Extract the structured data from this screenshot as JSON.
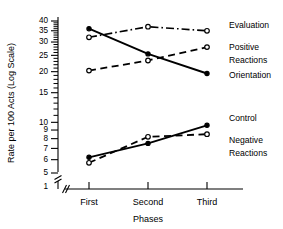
{
  "chart_data": {
    "type": "line",
    "title": "",
    "subtitle": "",
    "xlabel": "Phases",
    "ylabel": "Rate per 100 Acts (Log Scale)",
    "categories": [
      "First",
      "Second",
      "Third"
    ],
    "yscale": "log",
    "ylim": [
      5,
      40
    ],
    "y_axis_break": true,
    "y_axis_break_label": "1",
    "x_axis_break": true,
    "grid": false,
    "legend_position": "right-inline",
    "ytick_labels": [
      "40",
      "35",
      "30",
      "25",
      "20",
      "15",
      "10",
      "9",
      "8",
      "7",
      "6",
      "5",
      "1"
    ],
    "ytick_values": [
      40,
      35,
      30,
      25,
      20,
      15,
      10,
      9,
      8,
      7,
      6,
      5,
      1
    ],
    "yminor_ticks": [
      39,
      38,
      37,
      36,
      34,
      33,
      32,
      31,
      29,
      28,
      27,
      26,
      24,
      23,
      22,
      21,
      19,
      18,
      17,
      16,
      14,
      13,
      12,
      11
    ],
    "series": [
      {
        "name": "Evaluation",
        "values": [
          32,
          37,
          35
        ],
        "line_style": "dashdot",
        "marker": "open-circle",
        "label_x": 229,
        "label_y": 26
      },
      {
        "name": "Positive Reactions",
        "values": [
          20.3,
          23.3,
          28
        ],
        "line_style": "dashed",
        "marker": "open-circle",
        "label_x": 229,
        "label_y": 48
      },
      {
        "name": "Orientation",
        "values": [
          36,
          25.5,
          19.5
        ],
        "line_style": "solid",
        "marker": "filled-circle",
        "label_x": 229,
        "label_y": 76
      },
      {
        "name": "Control",
        "values": [
          6.2,
          7.5,
          9.6
        ],
        "line_style": "solid",
        "marker": "filled-circle",
        "label_x": 229,
        "label_y": 119
      },
      {
        "name": "Negative Reactions",
        "values": [
          5.75,
          8.2,
          8.5
        ],
        "line_style": "dashed",
        "marker": "open-circle",
        "label_x": 229,
        "label_y": 141
      }
    ],
    "series_label_lines": [
      {
        "name": "Evaluation",
        "lines": [
          "Evaluation"
        ]
      },
      {
        "name": "Positive Reactions",
        "lines": [
          "Positive",
          "Reactions"
        ]
      },
      {
        "name": "Orientation",
        "lines": [
          "Orientation"
        ]
      },
      {
        "name": "Control",
        "lines": [
          "Control"
        ]
      },
      {
        "name": "Negative Reactions",
        "lines": [
          "Negative",
          "Reactions"
        ]
      }
    ],
    "colors": {
      "ink": "#000000",
      "background": "#ffffff"
    }
  },
  "labels": {
    "y_axis_title": "Rate per 100 Acts (Log Scale)",
    "x_axis_title": "Phases",
    "x_first": "First",
    "x_second": "Second",
    "x_third": "Third",
    "y_40": "40",
    "y_35": "35",
    "y_30": "30",
    "y_25": "25",
    "y_20": "20",
    "y_15": "15",
    "y_10": "10",
    "y_9": "9",
    "y_8": "8",
    "y_7": "7",
    "y_6": "6",
    "y_5": "5",
    "y_1": "1",
    "s_evaluation": "Evaluation",
    "s_positive_1": "Positive",
    "s_positive_2": "Reactions",
    "s_orientation": "Orientation",
    "s_control": "Control",
    "s_negative_1": "Negative",
    "s_negative_2": "Reactions"
  }
}
